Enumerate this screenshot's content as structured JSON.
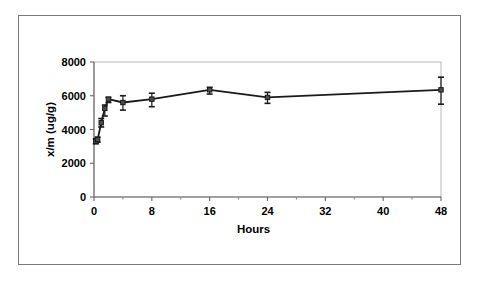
{
  "figure": {
    "background_color": "#ffffff",
    "border_color": "#7a7a7a",
    "series_color": "#1a1a1a"
  },
  "chart_data": {
    "type": "line",
    "title": "",
    "subtitle": "",
    "xlabel": "Hours",
    "ylabel": "x/m (ug/g)",
    "xlim": [
      0,
      48
    ],
    "ylim": [
      0,
      8000
    ],
    "xticks": [
      0,
      8,
      16,
      24,
      32,
      40,
      48
    ],
    "xtick_labels": [
      "0",
      "8",
      "16",
      "24",
      "32",
      "40",
      "48"
    ],
    "x_minor_ticks": [
      4,
      12,
      20,
      28,
      36,
      44
    ],
    "yticks": [
      0,
      2000,
      4000,
      6000,
      8000
    ],
    "ytick_labels": [
      "0",
      "2000",
      "4000",
      "6000",
      "8000"
    ],
    "grid": false,
    "legend": null,
    "legend_position": "none",
    "marker": "square",
    "error_bars": "vertical",
    "x": [
      0.25,
      0.5,
      1,
      1.5,
      2,
      4,
      8,
      16,
      24,
      48
    ],
    "y": [
      3300,
      3400,
      4400,
      5250,
      5800,
      5600,
      5800,
      6350,
      5900,
      6350
    ],
    "yerr_low": [
      3150,
      3250,
      4150,
      4800,
      5600,
      5150,
      5350,
      6100,
      5550,
      5500
    ],
    "yerr_high": [
      3450,
      3550,
      4650,
      5450,
      5900,
      6000,
      6150,
      6500,
      6200,
      7100
    ],
    "series": [
      {
        "name": "x/m",
        "values": [
          3300,
          3400,
          4400,
          5250,
          5800,
          5600,
          5800,
          6350,
          5900,
          6350
        ]
      }
    ]
  }
}
